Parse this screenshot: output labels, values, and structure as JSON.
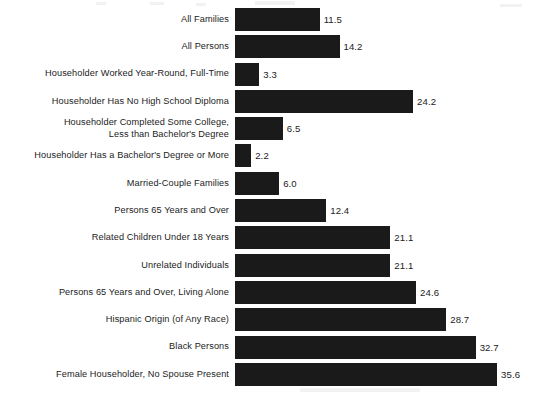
{
  "chart_data": {
    "type": "bar",
    "orientation": "horizontal",
    "title": "",
    "subtitle": "",
    "xlabel": "",
    "ylabel": "",
    "xlim": [
      0,
      35.6
    ],
    "grid": false,
    "legend": null,
    "bar_color": "#1a1a1a",
    "background_color": "#ffffff",
    "value_label_format": "one-decimal",
    "categories": [
      "All Families",
      "All Persons",
      "Householder Worked Year-Round, Full-Time",
      "Householder Has No High School Diploma",
      "Householder Completed Some College,\nLess than Bachelor's Degree",
      "Householder Has a Bachelor's Degree or More",
      "Married-Couple Families",
      "Persons 65 Years and Over",
      "Related Children Under 18 Years",
      "Unrelated Individuals",
      "Persons 65 Years and Over, Living Alone",
      "Hispanic Origin (of Any Race)",
      "Black Persons",
      "Female Householder, No Spouse Present"
    ],
    "values": [
      11.5,
      14.2,
      3.3,
      24.2,
      6.5,
      2.2,
      6.0,
      12.4,
      21.1,
      21.1,
      24.6,
      28.7,
      32.7,
      35.6
    ],
    "value_labels": [
      "11.5",
      "14.2",
      "3.3",
      "24.2",
      "6.5",
      "2.2",
      "6.0",
      "12.4",
      "21.1",
      "21.1",
      "24.6",
      "28.7",
      "32.7",
      "35.6"
    ]
  }
}
